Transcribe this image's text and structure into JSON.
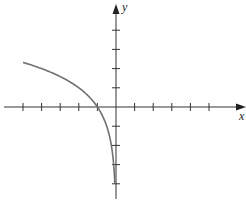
{
  "chart_data": {
    "type": "line",
    "title": "",
    "xlabel": "x",
    "ylabel": "y",
    "function": "y = log2(-x)",
    "xlim": [
      -6,
      7
    ],
    "ylim": [
      -5,
      5
    ],
    "x_ticks": [
      -5,
      -4,
      -3,
      -2,
      -1,
      1,
      2,
      3,
      4,
      5
    ],
    "y_ticks": [
      -4,
      -3,
      -2,
      -1,
      1,
      2,
      3,
      4
    ],
    "tick_labels_shown": false,
    "grid": false,
    "legend": null,
    "series": [
      {
        "name": "curve",
        "color": "#707070",
        "x": [
          -5,
          -4,
          -3,
          -2,
          -1.5,
          -1,
          -0.75,
          -0.5,
          -0.35,
          -0.25,
          -0.177,
          -0.125,
          -0.088,
          -0.0625
        ],
        "y": [
          2.32,
          2,
          1.58,
          1,
          0.58,
          0,
          -0.42,
          -1,
          -1.51,
          -2,
          -2.5,
          -3,
          -3.5,
          -4
        ]
      }
    ]
  },
  "labels": {
    "x_axis": "x",
    "y_axis": "y"
  }
}
